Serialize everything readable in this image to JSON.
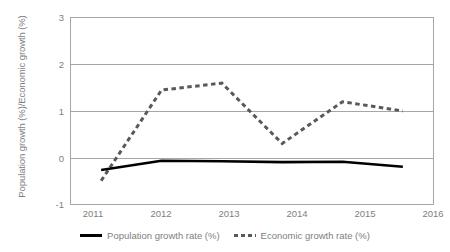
{
  "chart_data": {
    "type": "line",
    "title": "",
    "xlabel": "",
    "ylabel": "Population growth (%)/Economic growth (%)",
    "categories": [
      "2011",
      "2012",
      "2013",
      "2014",
      "2015",
      "2016"
    ],
    "x_tick_labels": [
      "2011",
      "2012",
      "2013",
      "2014",
      "2015",
      "2016"
    ],
    "y_tick_labels": [
      "-1",
      "0",
      "1",
      "2",
      "3"
    ],
    "y_tick_values": [
      -1,
      0,
      1,
      2,
      3
    ],
    "ylim": [
      -1,
      3
    ],
    "grid": "horizontal",
    "legend_position": "bottom",
    "series": [
      {
        "name": "Population growth rate (%)",
        "style": "solid",
        "color": "#000000",
        "values": [
          -0.27,
          -0.07,
          -0.08,
          -0.1,
          -0.09,
          -0.2
        ]
      },
      {
        "name": "Economic growth rate (%)",
        "style": "dotted",
        "color": "#595959",
        "values": [
          -0.5,
          1.45,
          1.6,
          0.3,
          1.2,
          1.0
        ]
      }
    ]
  },
  "axis": {
    "y_title": "Population growth (%)/Economic growth (%)",
    "y_ticks": [
      "3",
      "2",
      "1",
      "0",
      "-1"
    ],
    "x_ticks": [
      "2011",
      "2012",
      "2013",
      "2014",
      "2015",
      "2016"
    ]
  },
  "legend": {
    "items": [
      {
        "label": "Population growth rate (%)",
        "marker": "solid-line-swatch"
      },
      {
        "label": "Economic growth rate (%)",
        "marker": "dotted-line-swatch"
      }
    ]
  }
}
